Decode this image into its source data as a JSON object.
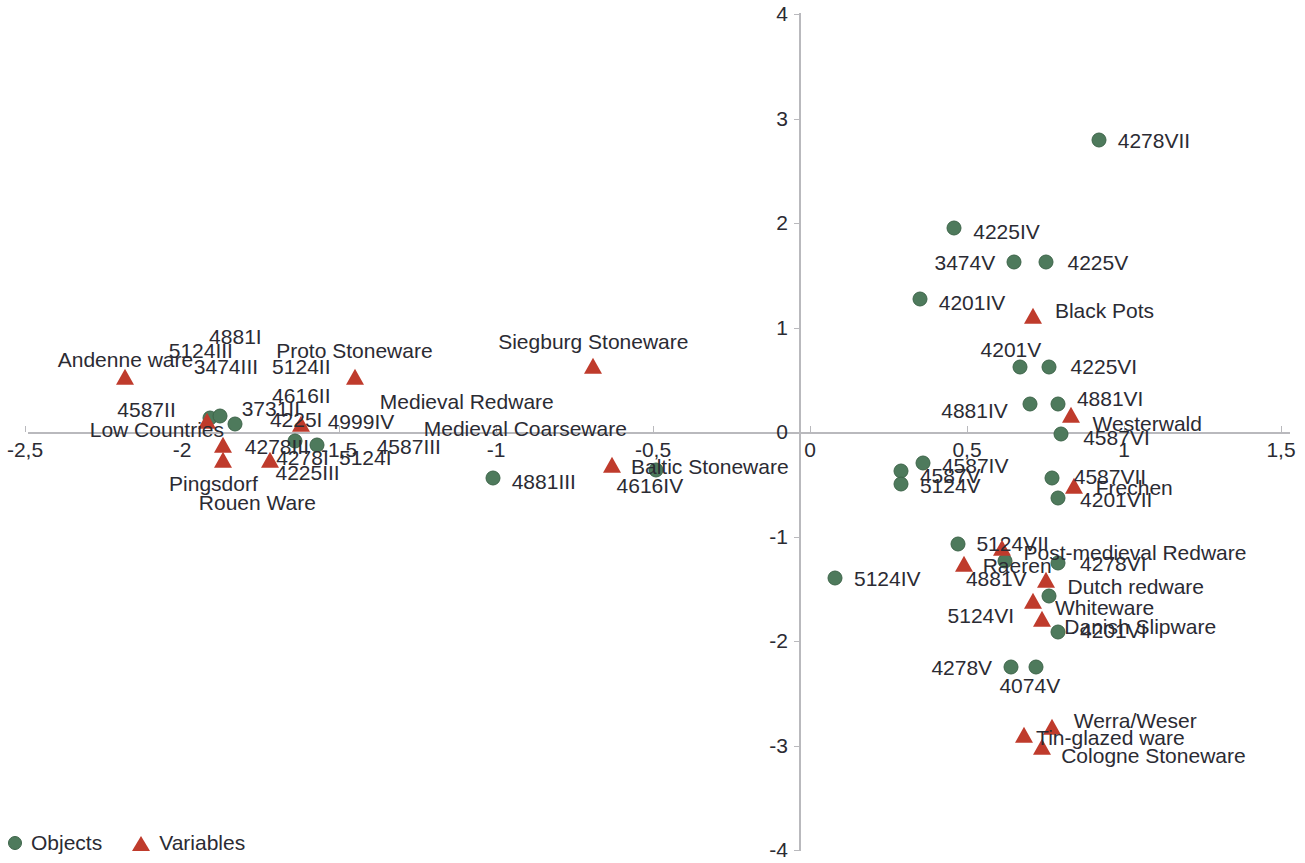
{
  "chart_data": {
    "type": "scatter",
    "title": "",
    "subtitle": "",
    "xlabel": "",
    "ylabel": "",
    "xlim": [
      -2.5,
      1.5
    ],
    "ylim": [
      -4,
      4
    ],
    "grid": false,
    "legend_position": "bottom-left",
    "decimal_separator": ",",
    "xticks": [
      {
        "value": -2.5,
        "label": "-2,5"
      },
      {
        "value": -2,
        "label": "-2"
      },
      {
        "value": -1.5,
        "label": "-1,5"
      },
      {
        "value": -1,
        "label": "-1"
      },
      {
        "value": -0.5,
        "label": "-0,5"
      },
      {
        "value": 0,
        "label": "0"
      },
      {
        "value": 0.5,
        "label": "0,5"
      },
      {
        "value": 1,
        "label": "1"
      },
      {
        "value": 1.5,
        "label": "1,5"
      }
    ],
    "yticks": [
      {
        "value": 4,
        "label": "4"
      },
      {
        "value": 3,
        "label": "3"
      },
      {
        "value": 2,
        "label": "2"
      },
      {
        "value": 1,
        "label": "1"
      },
      {
        "value": 0,
        "label": "0"
      },
      {
        "value": -1,
        "label": "-1"
      },
      {
        "value": -2,
        "label": "-2"
      },
      {
        "value": -3,
        "label": "-3"
      },
      {
        "value": -4,
        "label": "-4"
      }
    ],
    "legend": [
      {
        "key": "objects",
        "label": "Objects",
        "marker": "circle",
        "color": "#4e7a5c"
      },
      {
        "key": "variables",
        "label": "Variables",
        "marker": "triangle",
        "color": "#bf3b2c"
      }
    ],
    "series": [
      {
        "name": "Objects",
        "marker": "circle",
        "color": "#4e7a5c",
        "points": [
          {
            "label": "4587II",
            "x": -1.91,
            "y": 0.13,
            "lx": -2.02,
            "ly": 0.22,
            "anchor": "end"
          },
          {
            "label": "3731II",
            "x": -1.88,
            "y": 0.15,
            "lx": -1.81,
            "ly": 0.23,
            "anchor": "start"
          },
          {
            "label": "4225I",
            "x": -1.83,
            "y": 0.08,
            "lx": -1.72,
            "ly": 0.12,
            "anchor": "start"
          },
          {
            "label": "4278I",
            "x": -1.64,
            "y": -0.09,
            "lx": -1.7,
            "ly": -0.24,
            "anchor": "start"
          },
          {
            "label": "5124I",
            "x": -1.57,
            "y": -0.12,
            "lx": -1.5,
            "ly": -0.24,
            "anchor": "start"
          },
          {
            "label": "4881III",
            "x": -1.01,
            "y": -0.44,
            "lx": -0.95,
            "ly": -0.47,
            "anchor": "start"
          },
          {
            "label": "4616IV",
            "x": -0.49,
            "y": -0.36,
            "lx": -0.51,
            "ly": -0.51,
            "anchor": "mid"
          },
          {
            "label": "4278VII",
            "x": 0.92,
            "y": 2.79,
            "lx": 0.98,
            "ly": 2.79,
            "anchor": "start"
          },
          {
            "label": "4225IV",
            "x": 0.46,
            "y": 1.95,
            "lx": 0.52,
            "ly": 1.92,
            "anchor": "start"
          },
          {
            "label": "3474V",
            "x": 0.65,
            "y": 1.63,
            "lx": 0.59,
            "ly": 1.63,
            "anchor": "end"
          },
          {
            "label": "4225V",
            "x": 0.75,
            "y": 1.63,
            "lx": 0.82,
            "ly": 1.63,
            "anchor": "start"
          },
          {
            "label": "4201IV",
            "x": 0.35,
            "y": 1.27,
            "lx": 0.41,
            "ly": 1.24,
            "anchor": "start"
          },
          {
            "label": "4201V",
            "x": 0.67,
            "y": 0.62,
            "lx": 0.64,
            "ly": 0.79,
            "anchor": "mid"
          },
          {
            "label": "4225VI",
            "x": 0.76,
            "y": 0.62,
            "lx": 0.83,
            "ly": 0.63,
            "anchor": "start"
          },
          {
            "label": "4881IV",
            "x": 0.7,
            "y": 0.27,
            "lx": 0.63,
            "ly": 0.21,
            "anchor": "end"
          },
          {
            "label": "4881VI",
            "x": 0.79,
            "y": 0.27,
            "lx": 0.85,
            "ly": 0.33,
            "anchor": "start"
          },
          {
            "label": "4587VI",
            "x": 0.8,
            "y": -0.02,
            "lx": 0.87,
            "ly": -0.05,
            "anchor": "start"
          },
          {
            "label": "4587IV",
            "x": 0.36,
            "y": -0.3,
            "lx": 0.42,
            "ly": -0.32,
            "anchor": "start"
          },
          {
            "label": "4587V",
            "x": 0.29,
            "y": -0.37,
            "lx": 0.35,
            "ly": -0.41,
            "anchor": "start"
          },
          {
            "label": "5124V",
            "x": 0.29,
            "y": -0.5,
            "lx": 0.35,
            "ly": -0.51,
            "anchor": "start"
          },
          {
            "label": "4587VII",
            "x": 0.77,
            "y": -0.44,
            "lx": 0.84,
            "ly": -0.42,
            "anchor": "start"
          },
          {
            "label": "4201VII",
            "x": 0.79,
            "y": -0.63,
            "lx": 0.86,
            "ly": -0.64,
            "anchor": "start"
          },
          {
            "label": "5124VII",
            "x": 0.47,
            "y": -1.07,
            "lx": 0.53,
            "ly": -1.06,
            "anchor": "start"
          },
          {
            "label": "4278VI",
            "x": 0.79,
            "y": -1.25,
            "lx": 0.86,
            "ly": -1.25,
            "anchor": "start"
          },
          {
            "label": "5124IV",
            "x": 0.08,
            "y": -1.4,
            "lx": 0.14,
            "ly": -1.4,
            "anchor": "start"
          },
          {
            "label": "4881V",
            "x": 0.62,
            "y": -1.23,
            "lx": 0.69,
            "ly": -1.4,
            "anchor": "end"
          },
          {
            "label": "5124VI",
            "x": 0.76,
            "y": -1.57,
            "lx": 0.65,
            "ly": -1.75,
            "anchor": "end"
          },
          {
            "label": "4201VI",
            "x": 0.79,
            "y": -1.91,
            "lx": 0.86,
            "ly": -1.89,
            "anchor": "start"
          },
          {
            "label": "4278V",
            "x": 0.64,
            "y": -2.25,
            "lx": 0.58,
            "ly": -2.25,
            "anchor": "end"
          },
          {
            "label": "4074V",
            "x": 0.72,
            "y": -2.25,
            "lx": 0.7,
            "ly": -2.42,
            "anchor": "mid"
          }
        ]
      },
      {
        "name": "Variables",
        "marker": "triangle",
        "color": "#bf3b2c",
        "points": [
          {
            "label": "Andenne ware",
            "x": -2.18,
            "y": 0.52,
            "lx": -2.18,
            "ly": 0.7,
            "anchor": "mid"
          },
          {
            "label": "4881I",
            "x": -1.92,
            "y": 0.1,
            "lx": -1.83,
            "ly": 0.92,
            "anchor": "mid"
          },
          {
            "label": "5124III",
            "x": -1.92,
            "y": 0.1,
            "lx": -1.94,
            "ly": 0.78,
            "anchor": "mid"
          },
          {
            "label": "Proto Stoneware",
            "x": -1.45,
            "y": 0.52,
            "lx": -1.7,
            "ly": 0.78,
            "anchor": "start"
          },
          {
            "label": "3474III",
            "x": -1.92,
            "y": 0.1,
            "lx": -1.86,
            "ly": 0.63,
            "anchor": "mid"
          },
          {
            "label": "5124II",
            "x": -1.92,
            "y": 0.1,
            "lx": -1.62,
            "ly": 0.63,
            "anchor": "mid"
          },
          {
            "label": "4616II",
            "x": -1.62,
            "y": 0.07,
            "lx": -1.62,
            "ly": 0.35,
            "anchor": "mid"
          },
          {
            "label": "Medieval Redware",
            "x": -1.62,
            "y": 0.07,
            "lx": -1.37,
            "ly": 0.3,
            "anchor": "start"
          },
          {
            "label": "4999IV",
            "x": -1.62,
            "y": 0.07,
            "lx": -1.43,
            "ly": 0.11,
            "anchor": "mid"
          },
          {
            "label": "Low Countries",
            "x": -1.92,
            "y": 0.1,
            "lx": -2.08,
            "ly": 0.03,
            "anchor": "mid"
          },
          {
            "label": "Medieval Coarseware",
            "x": -1.62,
            "y": 0.07,
            "lx": -1.23,
            "ly": 0.04,
            "anchor": "start"
          },
          {
            "label": "4278III",
            "x": -1.87,
            "y": -0.13,
            "lx": -1.8,
            "ly": -0.13,
            "anchor": "start"
          },
          {
            "label": "4587III",
            "x": -1.62,
            "y": 0.07,
            "lx": -1.38,
            "ly": -0.13,
            "anchor": "start"
          },
          {
            "label": "4225III",
            "x": -1.72,
            "y": -0.28,
            "lx": -1.6,
            "ly": -0.38,
            "anchor": "mid"
          },
          {
            "label": "Pingsdorf",
            "x": -1.87,
            "y": -0.28,
            "lx": -1.9,
            "ly": -0.49,
            "anchor": "mid"
          },
          {
            "label": "Rouen Ware",
            "x": -1.72,
            "y": -0.28,
            "lx": -1.76,
            "ly": -0.67,
            "anchor": "mid"
          },
          {
            "label": "Siegburg Stoneware",
            "x": -0.69,
            "y": 0.62,
            "lx": -0.69,
            "ly": 0.87,
            "anchor": "mid"
          },
          {
            "label": "Baltic Stoneware",
            "x": -0.63,
            "y": -0.33,
            "lx": -0.57,
            "ly": -0.33,
            "anchor": "start"
          },
          {
            "label": "Black Pots",
            "x": 0.71,
            "y": 1.1,
            "lx": 0.78,
            "ly": 1.17,
            "anchor": "start"
          },
          {
            "label": "Westerwald",
            "x": 0.83,
            "y": 0.15,
            "lx": 0.9,
            "ly": 0.09,
            "anchor": "start"
          },
          {
            "label": "Frechen",
            "x": 0.84,
            "y": -0.53,
            "lx": 0.91,
            "ly": -0.53,
            "anchor": "start"
          },
          {
            "label": "Post-medieval Redware",
            "x": 0.61,
            "y": -1.12,
            "lx": 0.68,
            "ly": -1.15,
            "anchor": "start"
          },
          {
            "label": "Raeren",
            "x": 0.49,
            "y": -1.27,
            "lx": 0.55,
            "ly": -1.27,
            "anchor": "start"
          },
          {
            "label": "Dutch redware",
            "x": 0.75,
            "y": -1.43,
            "lx": 0.82,
            "ly": -1.47,
            "anchor": "start"
          },
          {
            "label": "Whiteware",
            "x": 0.71,
            "y": -1.63,
            "lx": 0.78,
            "ly": -1.67,
            "anchor": "start"
          },
          {
            "label": "Danish Slipware",
            "x": 0.74,
            "y": -1.8,
            "lx": 0.81,
            "ly": -1.86,
            "anchor": "start"
          },
          {
            "label": "Werra/Weser",
            "x": 0.77,
            "y": -2.83,
            "lx": 0.84,
            "ly": -2.76,
            "anchor": "start"
          },
          {
            "label": "Tin-glazed ware",
            "x": 0.68,
            "y": -2.91,
            "lx": 0.72,
            "ly": -2.92,
            "anchor": "start"
          },
          {
            "label": "Cologne Stoneware",
            "x": 0.74,
            "y": -3.02,
            "lx": 0.8,
            "ly": -3.09,
            "anchor": "start"
          }
        ]
      }
    ]
  }
}
